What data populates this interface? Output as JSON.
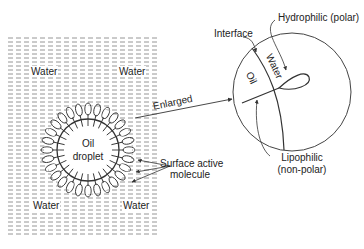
{
  "diagram": {
    "left_panel": {
      "region_label_tl": "Water",
      "region_label_tr": "Water",
      "region_label_bl": "Water",
      "region_label_br": "Water",
      "droplet_label_line1": "Oil",
      "droplet_label_line2": "droplet",
      "surfactant_label_line1": "Surface active",
      "surfactant_label_line2": "molecule"
    },
    "connector_label": "Enlarged",
    "enlarged_view": {
      "interface_label": "Interface",
      "hydrophilic_label": "Hydrophilic (polar)",
      "oil_side_label": "Oil",
      "water_side_label": "Water",
      "lipophilic_label_line1": "Lipophilic",
      "lipophilic_label_line2": "(non-polar)"
    },
    "colors": {
      "ink": "#333333",
      "hatch": "#8a8a8a",
      "background": "#ffffff"
    }
  }
}
